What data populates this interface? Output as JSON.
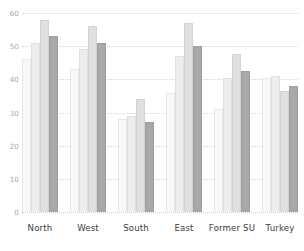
{
  "chart_data": {
    "type": "bar",
    "title": "",
    "subtitle": "",
    "xlabel": "",
    "ylabel": "",
    "categories": [
      "North",
      "West",
      "South",
      "East",
      "Former SU",
      "Turkey"
    ],
    "ylim": [
      0,
      60
    ],
    "yticks": [
      0,
      10,
      20,
      30,
      40,
      50,
      60
    ],
    "ytick_labels": [
      "0",
      "10",
      "20",
      "30",
      "40",
      "50",
      "60"
    ],
    "grid": true,
    "grid_style": "dotted",
    "legend": "none",
    "series": [
      {
        "name": "Series 1",
        "color": "#f7f7f7",
        "values": [
          46,
          43,
          28,
          36,
          31,
          40.5
        ]
      },
      {
        "name": "Series 2",
        "color": "#ededed",
        "values": [
          51,
          49,
          29,
          47,
          40.5,
          41
        ]
      },
      {
        "name": "Series 3",
        "color": "#e0e0e0",
        "values": [
          58,
          56,
          34,
          57,
          47.5,
          36.5
        ]
      },
      {
        "name": "Series 4",
        "color": "#a8a8a8",
        "values": [
          53,
          51,
          27,
          50,
          42.5,
          38
        ]
      }
    ]
  },
  "axes": {
    "y_tick_color": "#a8a8a8",
    "x_tick_color": "#3d3d3d",
    "gridline_color": "#d7d7d7"
  }
}
